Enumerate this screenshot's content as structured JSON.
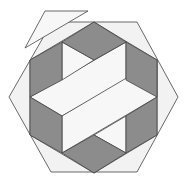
{
  "figure": {
    "title": "Hexagonal tiling puzzle",
    "colors": {
      "background": "#ffffff",
      "light_fill": "#f2f2f2",
      "dark_fill": "#8c8c8c",
      "stroke": "#444444"
    },
    "pieces": {
      "outer_hexagon": "52,22 137,22 178,97 137,172 51,172 9,97",
      "detached_triangle": "45,11 88,11 25,48",
      "inner_hexagon": "94,22 157,60 157,135 94,173 30,135 30,60",
      "dark_top": "94,22 126,42 94,60 62,42",
      "dark_upper_left": "30,60 62,42 62,80 30,97",
      "dark_upper_right": "126,42 157,60 157,97 126,80",
      "dark_lower_left": "30,97 62,116 62,153 30,135",
      "dark_lower_right": "157,97 157,135 126,153 126,116",
      "dark_bottom": "62,153 94,135 126,153 94,173",
      "light_center_band": "30,97 126,42 126,80 62,116",
      "light_center_band_2": "62,116 157,60 157,97 62,153",
      "light_top_notch": "62,42 94,60 62,80",
      "light_bottom_notch": "126,116 126,153 94,135"
    }
  }
}
